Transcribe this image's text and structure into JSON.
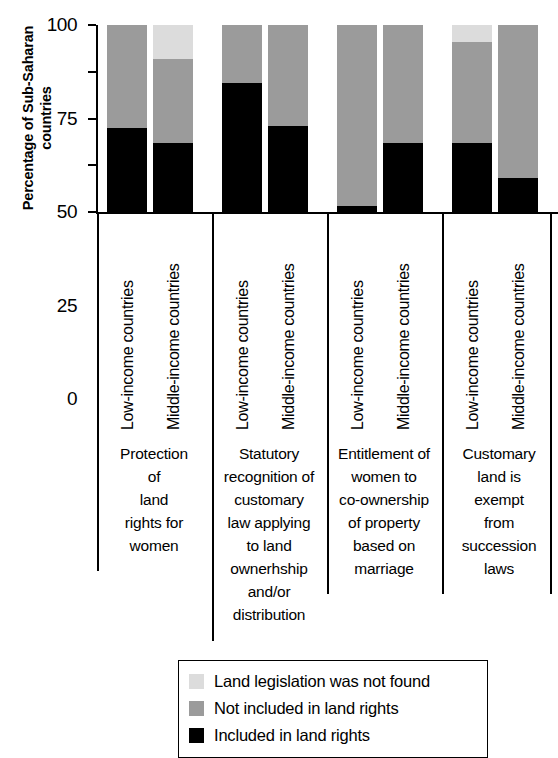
{
  "chart_data": {
    "type": "bar",
    "subtype": "stacked-bar-100-percent",
    "title": "",
    "xlabel": "",
    "ylabel": "Percentage of Sub-Saharan countries",
    "ylim": [
      0,
      100
    ],
    "yticks": [
      0,
      25,
      50,
      75,
      100
    ],
    "ytick_labels": [
      "0",
      "25",
      "50",
      "75",
      "100"
    ],
    "grid": false,
    "legend_position": "bottom",
    "categories": [
      "Low-income countries",
      "Middle-income countries",
      "Low-income countries",
      "Middle-income countries",
      "Low-income countries",
      "Middle-income countries",
      "Low-income countries",
      "Middle-income countries"
    ],
    "groups": [
      {
        "caption": "Protection of land rights for women",
        "caption_lines": [
          "Protection",
          "of",
          "land",
          "rights for",
          "women"
        ],
        "bars": [
          {
            "category": "Low-income countries",
            "included": 45,
            "not_included": 55,
            "not_found": 0
          },
          {
            "category": "Middle-income countries",
            "included": 37,
            "not_included": 45,
            "not_found": 18
          }
        ]
      },
      {
        "caption": "Statutory recognition of customary law applying to land ownerhship and/or distribution",
        "caption_lines": [
          "Statutory",
          "recognition of",
          "customary",
          "law applying",
          "to land",
          "ownerhship",
          "and/or",
          "distribution"
        ],
        "bars": [
          {
            "category": "Low-income countries",
            "included": 69,
            "not_included": 31,
            "not_found": 0
          },
          {
            "category": "Middle-income countries",
            "included": 46,
            "not_included": 54,
            "not_found": 0
          }
        ]
      },
      {
        "caption": "Entitlement of women to co-ownership of property based on marriage",
        "caption_lines": [
          "Entitlement of",
          "women to",
          "co-ownership",
          "of property",
          "based on",
          "marriage"
        ],
        "bars": [
          {
            "category": "Low-income countries",
            "included": 3,
            "not_included": 97,
            "not_found": 0
          },
          {
            "category": "Middle-income countries",
            "included": 37,
            "not_included": 63,
            "not_found": 0
          }
        ]
      },
      {
        "caption": "Customary land is exempt from succession laws",
        "caption_lines": [
          "Customary",
          "land is",
          "exempt",
          "from",
          "succession",
          "laws"
        ],
        "bars": [
          {
            "category": "Low-income countries",
            "included": 37,
            "not_included": 54,
            "not_found": 9
          },
          {
            "category": "Middle-income countries",
            "included": 18,
            "not_included": 82,
            "not_found": 0
          }
        ]
      }
    ],
    "series": [
      {
        "name": "Included in land rights",
        "key": "included",
        "color": "#000000",
        "values": [
          45,
          37,
          69,
          46,
          3,
          37,
          37,
          18
        ]
      },
      {
        "name": "Not included in land rights",
        "key": "not_included",
        "color": "#9b9b9b",
        "values": [
          55,
          45,
          31,
          54,
          97,
          63,
          54,
          82
        ]
      },
      {
        "name": "Land legislation was not found",
        "key": "not_found",
        "color": "#dcdcdc",
        "values": [
          0,
          18,
          0,
          0,
          0,
          0,
          9,
          0
        ]
      }
    ],
    "legend": [
      {
        "label": "Land legislation was not found",
        "color": "#dcdcdc"
      },
      {
        "label": "Not included in land rights",
        "color": "#9b9b9b"
      },
      {
        "label": "Included in land rights",
        "color": "#000000"
      }
    ]
  }
}
